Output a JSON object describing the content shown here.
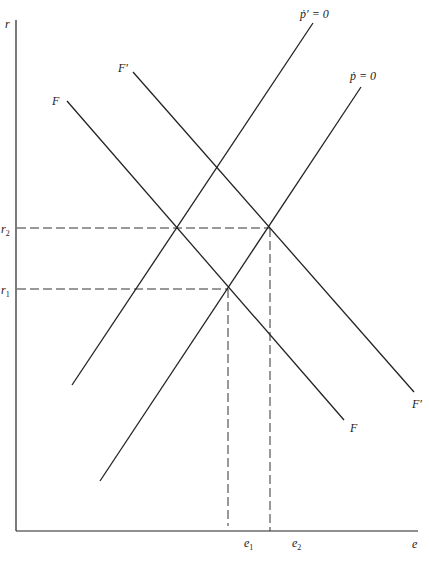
{
  "diagram": {
    "axes": {
      "y_label": "r",
      "x_label": "e"
    },
    "y_ticks": [
      {
        "label": "r",
        "sub": "2"
      },
      {
        "label": "r",
        "sub": "1"
      }
    ],
    "x_ticks": [
      {
        "label": "e",
        "sub": "1"
      },
      {
        "label": "e",
        "sub": "2"
      }
    ],
    "curves": {
      "F": {
        "label_start": "F",
        "label_end": "F"
      },
      "F_prime": {
        "label_start": "F′",
        "label_end": "F′"
      },
      "p_dot_prime": {
        "label": "ṗ′ = 0"
      },
      "p_dot": {
        "label": "ṗ = 0"
      }
    }
  }
}
